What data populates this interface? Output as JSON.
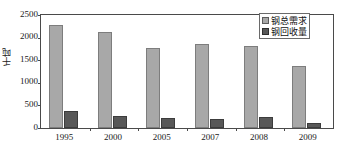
{
  "chart_data": {
    "type": "bar",
    "title": "",
    "subtitle": "",
    "xlabel": "",
    "ylabel": "千吨",
    "categories": [
      "1995",
      "2000",
      "2005",
      "2007",
      "2008",
      "2009"
    ],
    "series": [
      {
        "name": "钢总需求",
        "values": [
          2275,
          2125,
          1780,
          1850,
          1815,
          1370
        ],
        "color": "#a8a8a8"
      },
      {
        "name": "钢回收量",
        "values": [
          370,
          265,
          230,
          205,
          235,
          120
        ],
        "color": "#585858"
      }
    ],
    "ylim": [
      0,
      2500
    ],
    "y_ticks": [
      0,
      500,
      1000,
      1500,
      2000,
      2500
    ],
    "y_tick_labels": [
      "0",
      "500",
      "1000",
      "1500",
      "2000",
      "2500"
    ],
    "grid": false,
    "legend_position": "top-right",
    "legend_entries": [
      "钢总需求",
      "钢回收量"
    ]
  },
  "axes": {
    "y_title": "千吨"
  }
}
